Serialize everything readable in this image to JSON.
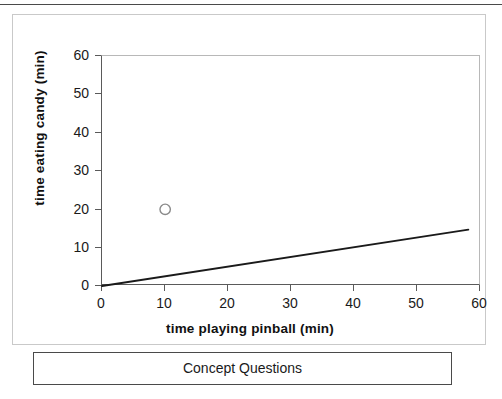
{
  "page": {
    "background": "#ffffff",
    "top_rule_color": "#4a4a4a"
  },
  "caption": {
    "text": "Concept Questions"
  },
  "chart_data": {
    "type": "scatter",
    "title": "",
    "subtitle": "",
    "xlabel": "time playing pinball (min)",
    "ylabel": "time eating candy (min)",
    "xlim": [
      0,
      60
    ],
    "ylim": [
      0,
      60
    ],
    "xticks": [
      0,
      10,
      20,
      30,
      40,
      50,
      60
    ],
    "yticks": [
      0,
      10,
      20,
      30,
      40,
      50,
      60
    ],
    "xtick_labels": [
      "0",
      "10",
      "20",
      "30",
      "40",
      "50",
      "60"
    ],
    "ytick_labels": [
      "0",
      "10",
      "20",
      "30",
      "40",
      "50",
      "60"
    ],
    "grid": false,
    "legend": null,
    "legend_position": "none",
    "series": [
      {
        "name": "data point",
        "type": "scatter",
        "marker": "open-circle",
        "marker_color": "#8a8a8a",
        "marker_fill": "#ffffff",
        "points": [
          {
            "x": 10,
            "y": 20
          }
        ]
      },
      {
        "name": "trend line",
        "type": "line",
        "color": "#1a1a1a",
        "points": [
          {
            "x": 0,
            "y": 0
          },
          {
            "x": 58,
            "y": 14.7
          }
        ]
      }
    ],
    "annotations": []
  }
}
